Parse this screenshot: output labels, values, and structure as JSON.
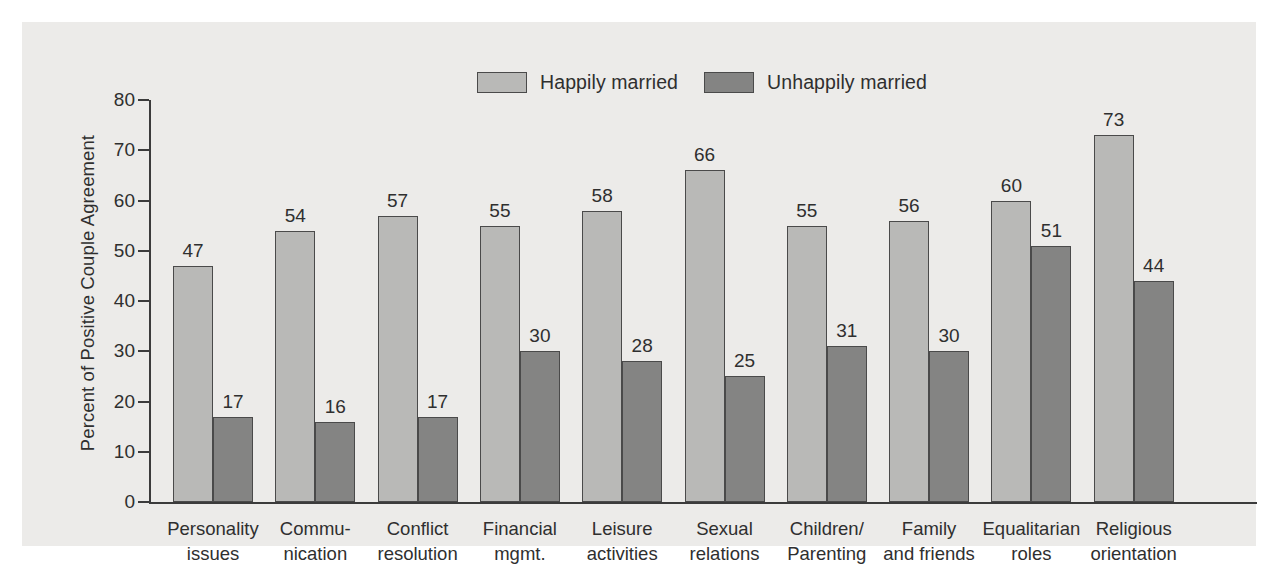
{
  "chart_data": {
    "type": "bar",
    "title": "",
    "xlabel": "",
    "ylabel": "Percent of Positive Couple Agreement",
    "ylim": [
      0,
      80
    ],
    "yticks": [
      0,
      10,
      20,
      30,
      40,
      50,
      60,
      70,
      80
    ],
    "grid": false,
    "legend_position": "top-center",
    "categories": [
      "Personality\nissues",
      "Commu-\nnication",
      "Conflict\nresolution",
      "Financial\nmgmt.",
      "Leisure\nactivities",
      "Sexual\nrelations",
      "Children/\nParenting",
      "Family\nand friends",
      "Equalitarian\nroles",
      "Religious\norientation"
    ],
    "category_lines": [
      [
        "Personality",
        "issues"
      ],
      [
        "Commu-",
        "nication"
      ],
      [
        "Conflict",
        "resolution"
      ],
      [
        "Financial",
        "mgmt."
      ],
      [
        "Leisure",
        "activities"
      ],
      [
        "Sexual",
        "relations"
      ],
      [
        "Children/",
        "Parenting"
      ],
      [
        "Family",
        "and friends"
      ],
      [
        "Equalitarian",
        "roles"
      ],
      [
        "Religious",
        "orientation"
      ]
    ],
    "series": [
      {
        "name": "Happily married",
        "color": "#b9b9b7",
        "values": [
          47,
          54,
          57,
          55,
          58,
          66,
          55,
          56,
          60,
          73
        ]
      },
      {
        "name": "Unhappily married",
        "color": "#848483",
        "values": [
          17,
          16,
          17,
          30,
          28,
          25,
          31,
          30,
          51,
          44
        ]
      }
    ]
  },
  "colors": {
    "panel_background": "#ecebe9",
    "page_background": "#ffffff",
    "axis": "#3b3b3b",
    "text": "#2f2f2f",
    "bar_border": "#4a4a4a",
    "happily_married": "#b9b9b7",
    "unhappily_married": "#848483"
  }
}
